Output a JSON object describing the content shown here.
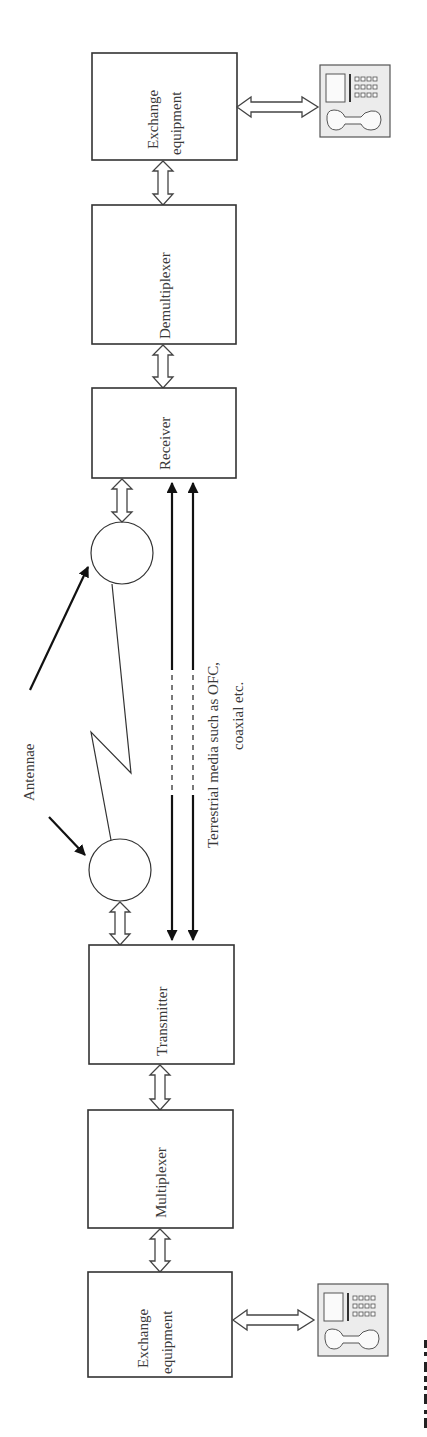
{
  "diagram": {
    "orientation": "rotated-90-ccw",
    "blocks": [
      {
        "id": "exchange-rx",
        "label_line1": "Exchange",
        "label_line2": "equipment"
      },
      {
        "id": "demultiplexer",
        "label": "Demultiplexer"
      },
      {
        "id": "receiver",
        "label": "Receiver"
      },
      {
        "id": "transmitter",
        "label": "Transmitter"
      },
      {
        "id": "multiplexer",
        "label": "Multiplexer"
      },
      {
        "id": "exchange-tx",
        "label_line1": "Exchange",
        "label_line2": "equipment"
      }
    ],
    "antennae_label": "Antennae",
    "terrestrial_label_line1": "Terrestrial media such as OFC,",
    "terrestrial_label_line2": "coaxial etc.",
    "icons": [
      "telephone-icon",
      "telephone-icon"
    ],
    "connections": [
      "exchange-tx <-> multiplexer",
      "multiplexer <-> transmitter",
      "transmitter <-> antenna-tx",
      "antenna-tx ~ radio link ~ antenna-rx",
      "antenna-rx <-> receiver",
      "transmitter -> terrestrial media -> receiver",
      "receiver <-> demultiplexer",
      "demultiplexer <-> exchange-rx",
      "exchange <-> telephone"
    ]
  }
}
